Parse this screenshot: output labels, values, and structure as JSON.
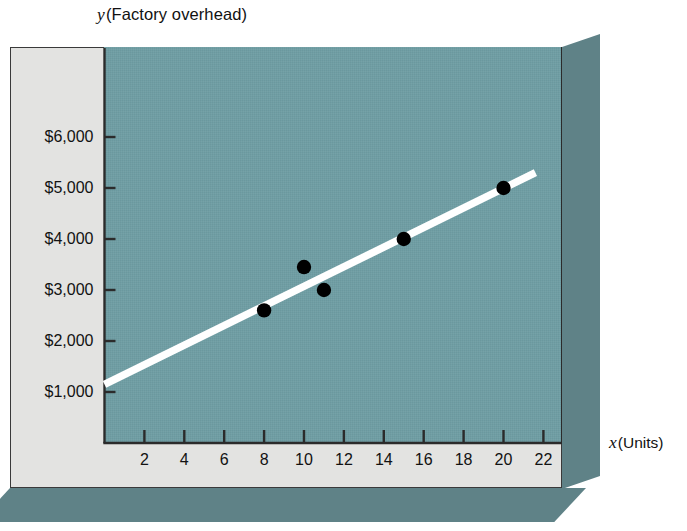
{
  "figure": {
    "kind": "scatter-diagram-with-regression-line",
    "y_axis_title_variable": "y",
    "y_axis_title_text": "(Factory overhead)",
    "x_axis_title_variable": "x",
    "x_axis_title_text": "(Units)",
    "plot_background_color": "#6f9ea4",
    "panel_background_color": "#e3e3e1",
    "slab_shadow_color": "#5f8287",
    "line_color": "#ffffff",
    "point_color": "#000000",
    "axis_color": "#2b2b2b"
  },
  "chart_data": {
    "type": "scatter",
    "title": "",
    "subtitle": "",
    "xlabel": "x (Units)",
    "ylabel": "y (Factory overhead)",
    "xlim": [
      0,
      23.3
    ],
    "ylim": [
      0,
      6900
    ],
    "grid": false,
    "legend": "none",
    "x_ticks": [
      2,
      4,
      6,
      8,
      10,
      12,
      14,
      16,
      18,
      20,
      22
    ],
    "x_tick_labels": [
      "2",
      "4",
      "6",
      "8",
      "10",
      "12",
      "14",
      "16",
      "18",
      "20",
      "22"
    ],
    "y_ticks": [
      1000,
      2000,
      3000,
      4000,
      5000,
      6000
    ],
    "y_tick_labels": [
      "$1,000",
      "$2,000",
      "$3,000",
      "$4,000",
      "$5,000",
      "$6,000"
    ],
    "series": [
      {
        "name": "Observed factory overhead",
        "type": "scatter",
        "marker": "filled-circle",
        "color": "#000000",
        "points": [
          {
            "x": 8,
            "y": 2600
          },
          {
            "x": 10,
            "y": 3450
          },
          {
            "x": 11,
            "y": 3000
          },
          {
            "x": 15,
            "y": 4000
          },
          {
            "x": 20,
            "y": 5000
          }
        ]
      },
      {
        "name": "Regression line",
        "type": "line",
        "color": "#ffffff",
        "endpoints": [
          {
            "x": 0.0,
            "y": 1150
          },
          {
            "x": 21.6,
            "y": 5300
          }
        ]
      }
    ]
  }
}
